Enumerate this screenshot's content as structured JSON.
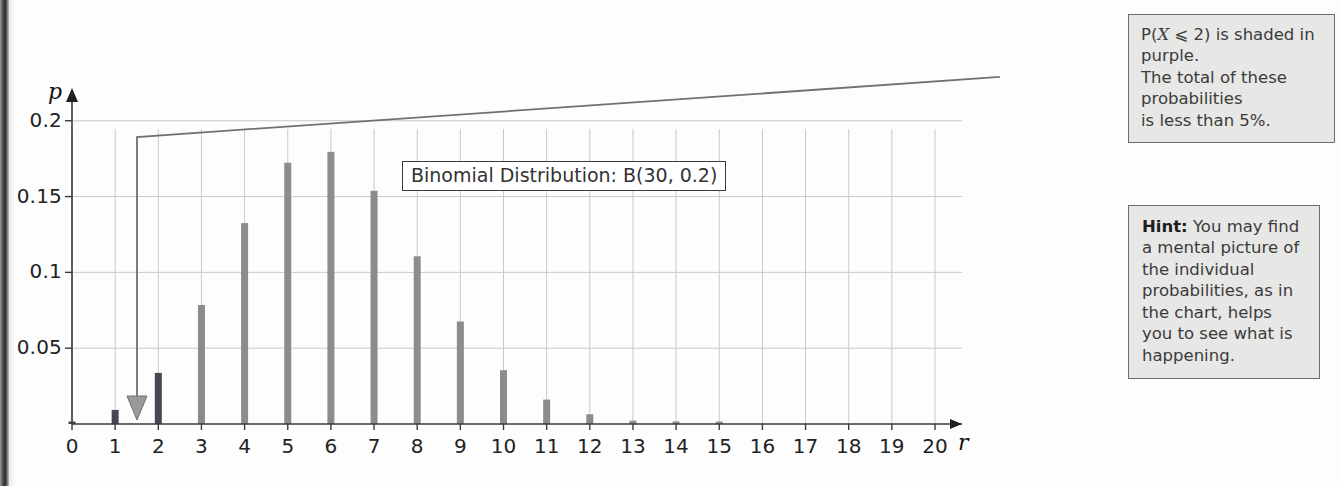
{
  "page": {
    "background": "#fdfdfd"
  },
  "chart_label": {
    "title_box": "Binomial Distribution: B(30, 0.2)"
  },
  "axes": {
    "y_axis_name": "p",
    "x_axis_name": "r",
    "y_ticks": [
      "0.05",
      "0.1",
      "0.15",
      "0.2"
    ],
    "x_ticks": [
      "0",
      "1",
      "2",
      "3",
      "4",
      "5",
      "6",
      "7",
      "8",
      "9",
      "10",
      "11",
      "12",
      "13",
      "14",
      "15",
      "16",
      "17",
      "18",
      "19",
      "20"
    ]
  },
  "callouts": {
    "shaded": {
      "name": "shaded-probability-callout",
      "line1_a": "P(",
      "line1_var": "X",
      "line1_b": " ⩽ 2) is shaded in purple.",
      "line2": "The total of these probabilities",
      "line3": "is less than 5%."
    },
    "hint": {
      "name": "hint-callout",
      "label": "Hint:",
      "text": " You may find a mental picture of the individual probabilities, as in the chart, helps you to see what is happening."
    }
  },
  "colors": {
    "shaded_bar": "#4b4453",
    "normal_bar": "#8c8c8c",
    "gridline": "#c9c9c9",
    "axis": "#3a3a3a",
    "callout_bg": "#e7e7e5",
    "callout_border": "#6d6d6d"
  },
  "chart_data": {
    "type": "bar",
    "title": "Binomial Distribution: B(30, 0.2)",
    "xlabel": "r",
    "ylabel": "p",
    "xlim": [
      0,
      20
    ],
    "ylim": [
      0,
      0.215
    ],
    "grid": true,
    "legend": "none",
    "categories": [
      0,
      1,
      2,
      3,
      4,
      5,
      6,
      7,
      8,
      9,
      10,
      11,
      12,
      13,
      14,
      15,
      16,
      17,
      18,
      19,
      20
    ],
    "values": [
      0.0012,
      0.0093,
      0.0337,
      0.0785,
      0.1325,
      0.1723,
      0.1795,
      0.1538,
      0.1106,
      0.0676,
      0.0355,
      0.0161,
      0.0064,
      0.0022,
      0.0007,
      0.0002,
      0.0,
      0.0,
      0.0,
      0.0,
      0.0
    ],
    "highlighted_categories": [
      0,
      1,
      2
    ],
    "annotation": "P(X ⩽ 2) is shaded in purple. The total of these probabilities is less than 5%."
  }
}
